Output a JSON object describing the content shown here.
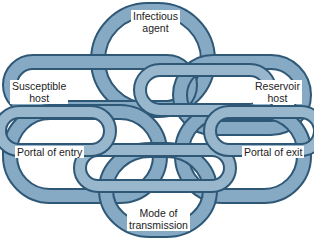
{
  "diagram": {
    "colors": {
      "link_fill_light": "#a9c3d6",
      "link_fill_mid": "#7fa3bf",
      "link_fill_dark": "#5b84a6",
      "link_outline": "#2f5877",
      "background": "#ffffff",
      "text": "#222222"
    },
    "nodes": [
      {
        "id": "infectious-agent",
        "line1": "Infectious",
        "line2": "agent"
      },
      {
        "id": "reservoir-host",
        "line1": "Reservoir",
        "line2": "host"
      },
      {
        "id": "portal-of-exit",
        "line1": "Portal of exit",
        "line2": ""
      },
      {
        "id": "mode-of-transmission",
        "line1": "Mode of",
        "line2": "transmission"
      },
      {
        "id": "portal-of-entry",
        "line1": "Portal of entry",
        "line2": ""
      },
      {
        "id": "susceptible-host",
        "line1": "Susceptible",
        "line2": "host"
      }
    ]
  }
}
